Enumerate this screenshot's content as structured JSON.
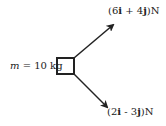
{
  "diagram": {
    "mass_label": {
      "var": "m",
      "rest": " = 10 kg"
    },
    "force1": {
      "open": "(6",
      "i": "i",
      "mid": " + 4",
      "j": "j",
      "close": ")N"
    },
    "force2": {
      "open": "(2",
      "i": "i",
      "mid": " - 3",
      "j": "j",
      "close": ")N"
    },
    "colors": {
      "ink": "#222222",
      "background": "#ffffff"
    }
  }
}
